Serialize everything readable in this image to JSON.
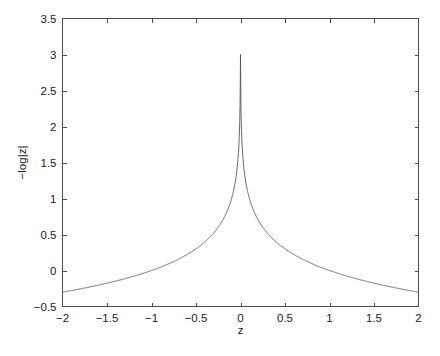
{
  "chart_data": {
    "type": "line",
    "title": "",
    "subtitle": "",
    "xlabel": "z",
    "ylabel": "−log|z|",
    "xlim": [
      -2,
      2
    ],
    "ylim": [
      -0.5,
      3.5
    ],
    "grid": false,
    "legend": null,
    "legend_position": "none",
    "xticks": [
      -2,
      -1.5,
      -1,
      -0.5,
      0,
      0.5,
      1,
      1.5,
      2
    ],
    "xticklabels": [
      "−2",
      "−1.5",
      "−1",
      "−0.5",
      "0",
      "0.5",
      "1",
      "1.5",
      "2"
    ],
    "yticks": [
      -0.5,
      0,
      0.5,
      1,
      1.5,
      2,
      2.5,
      3,
      3.5
    ],
    "yticklabels": [
      "−0.5",
      "0",
      "0.5",
      "1",
      "1.5",
      "2",
      "2.5",
      "3",
      "3.5"
    ],
    "series": [
      {
        "name": "−log|z|",
        "color": "#555555",
        "linewidth": 0.9,
        "formula": "y = -log10(|z|), clipped at y = 3",
        "peak_value": 3.0,
        "peak_x": 0,
        "endpoint_values": [
          -0.301,
          -0.301
        ],
        "x": [
          -2,
          -1.9,
          -1.8,
          -1.7,
          -1.6,
          -1.5,
          -1.4,
          -1.3,
          -1.2,
          -1.1,
          -1,
          -0.9,
          -0.8,
          -0.7,
          -0.6,
          -0.5,
          -0.4,
          -0.3,
          -0.25,
          -0.2,
          -0.15,
          -0.1,
          -0.07,
          -0.05,
          -0.03,
          -0.02,
          -0.015,
          -0.01,
          -0.005,
          -0.002,
          -0.001,
          0.001,
          0.002,
          0.005,
          0.01,
          0.015,
          0.02,
          0.03,
          0.05,
          0.07,
          0.1,
          0.15,
          0.2,
          0.25,
          0.3,
          0.4,
          0.5,
          0.6,
          0.7,
          0.8,
          0.9,
          1,
          1.1,
          1.2,
          1.3,
          1.4,
          1.5,
          1.6,
          1.7,
          1.8,
          1.9,
          2
        ],
        "y": [
          -0.301,
          -0.279,
          -0.255,
          -0.23,
          -0.204,
          -0.176,
          -0.146,
          -0.114,
          -0.079,
          -0.041,
          0.0,
          0.046,
          0.097,
          0.155,
          0.222,
          0.301,
          0.398,
          0.523,
          0.602,
          0.699,
          0.824,
          1.0,
          1.155,
          1.301,
          1.523,
          1.699,
          1.824,
          2.0,
          2.301,
          2.699,
          3.0,
          3.0,
          2.699,
          2.301,
          2.0,
          1.824,
          1.699,
          1.523,
          1.301,
          1.155,
          1.0,
          0.824,
          0.699,
          0.602,
          0.523,
          0.398,
          0.301,
          0.222,
          0.155,
          0.097,
          0.046,
          0.0,
          -0.041,
          -0.079,
          -0.114,
          -0.146,
          -0.176,
          -0.204,
          -0.23,
          -0.255,
          -0.279,
          -0.301
        ]
      }
    ],
    "style": {
      "background": "#ffffff",
      "axis_color": "#4d4d4d",
      "text_color": "#1a1a1a",
      "line_color": "#555555",
      "box": true,
      "tick_direction": "in"
    }
  }
}
